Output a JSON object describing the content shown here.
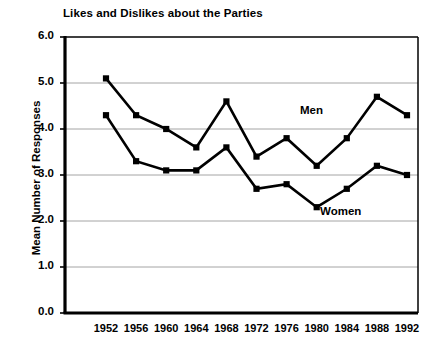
{
  "chart_data": {
    "type": "line",
    "title": "Likes and Dislikes about the Parties",
    "xlabel": "",
    "ylabel": "Mean Number of Responses",
    "categories": [
      "1952",
      "1956",
      "1960",
      "1964",
      "1968",
      "1972",
      "1976",
      "1980",
      "1984",
      "1988",
      "1992"
    ],
    "x": [
      1952,
      1956,
      1960,
      1964,
      1968,
      1972,
      1976,
      1980,
      1984,
      1988,
      1992
    ],
    "series": [
      {
        "name": "Men",
        "values": [
          5.1,
          4.3,
          4.0,
          3.6,
          4.6,
          3.4,
          3.8,
          3.2,
          3.8,
          4.7,
          4.3
        ]
      },
      {
        "name": "Women",
        "values": [
          4.3,
          3.3,
          3.1,
          3.1,
          3.6,
          2.7,
          2.8,
          2.3,
          2.7,
          3.2,
          3.0
        ]
      }
    ],
    "ylim": [
      0.0,
      6.0
    ],
    "ytick_labels": [
      "6.0",
      "5.0",
      "4.0",
      "3.0",
      "2.0",
      "1.0",
      "0.0"
    ],
    "ytick_values": [
      6.0,
      5.0,
      4.0,
      3.0,
      2.0,
      1.0,
      0.0
    ],
    "grid": true,
    "legend_position": "inline-annotations",
    "marker": "square",
    "line_color": "#000000",
    "grid_color": "#9a9a9a",
    "axis_color": "#000000",
    "background_color": "#ffffff",
    "annotations": [
      {
        "text": "Men",
        "series": "Men"
      },
      {
        "text": "Women",
        "series": "Women"
      }
    ]
  }
}
